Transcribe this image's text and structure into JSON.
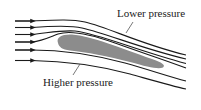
{
  "diagram": {
    "type": "airfoil-streamlines",
    "labels": {
      "lower_pressure": "Lower pressure",
      "higher_pressure": "Higher pressure"
    },
    "streamline_count": 6,
    "colors": {
      "streamline": "#1a1a1a",
      "airfoil_fill": "#8c8c8c",
      "leader_line": "#555555",
      "text": "#222222"
    }
  }
}
